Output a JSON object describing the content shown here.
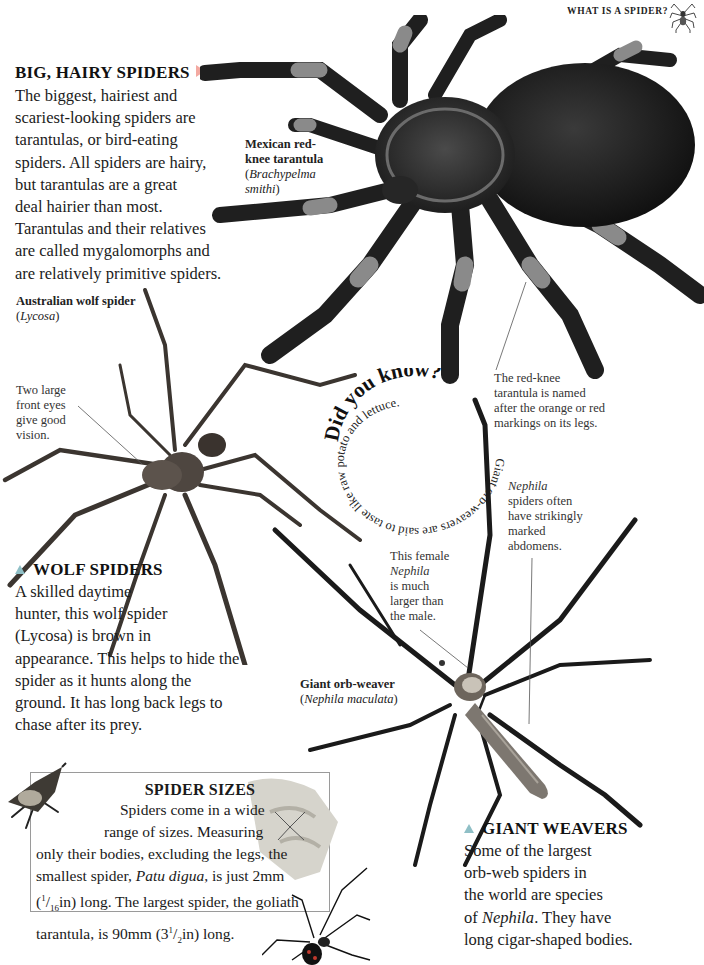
{
  "page": {
    "running_head": "WHAT IS A SPIDER?",
    "accent_colors": {
      "arrow_pink": "#f3a9a1",
      "arrow_teal": "#8fbfc6",
      "box_border": "#9a9a9a",
      "text": "#1b1b1b"
    }
  },
  "big_hairy": {
    "heading": "BIG, HAIRY SPIDERS",
    "lines": [
      "The biggest, hairiest and",
      "scariest-looking spiders are",
      "tarantulas, or bird-eating",
      "spiders. All spiders are hairy,",
      "but tarantulas are a great",
      "deal hairier than most.",
      "Tarantulas and their relatives",
      "are called mygalomorphs and",
      "are relatively primitive spiders."
    ]
  },
  "tarantula": {
    "label_line1": "Mexican red-",
    "label_line2": "knee tarantula",
    "latin_prefix": "(",
    "latin_line1": "Brachypelma",
    "latin_line2": "smithi",
    "latin_suffix": ")",
    "note_lines": [
      "The red-knee",
      "tarantula is named",
      "after the orange or red",
      "markings on its legs."
    ]
  },
  "wolf_spider": {
    "label": "Australian wolf spider",
    "latin": "Lycosa",
    "eyes_note": [
      "Two large",
      "front eyes",
      "give good",
      "vision."
    ],
    "heading": "WOLF SPIDERS",
    "lines": [
      "A skilled daytime",
      "hunter, this wolf spider",
      "(Lycosa) is brown in",
      "appearance. This helps to hide the",
      "spider as it hunts along the",
      "ground. It has long back legs to",
      "chase after its prey."
    ]
  },
  "did_you_know": {
    "title": "Did you know?",
    "spiral_text": "Giant orb-weavers are said to taste like raw potato and lettuce."
  },
  "orb_weaver": {
    "female_note": [
      "This female",
      "Nephila",
      "is much",
      "larger than",
      "the male."
    ],
    "abdomen_note": [
      "Nephila",
      "spiders often",
      "have strikingly",
      "marked",
      "abdomens."
    ],
    "label": "Giant orb-weaver",
    "latin": "Nephila maculata",
    "heading": "GIANT WEAVERS",
    "lines": [
      "Some of the largest",
      "orb-web spiders in",
      "the world are species",
      "of Nephila. They have",
      "long cigar-shaped bodies."
    ]
  },
  "spider_sizes": {
    "heading": "SPIDER SIZES",
    "line1": "Spiders come in a wide",
    "line2": "range of sizes. Measuring",
    "line3": "only their bodies, excluding the legs, the",
    "line4_a": "smallest spider, ",
    "line4_b": "Patu digua",
    "line4_c": ", is just 2mm",
    "line5_a": "(",
    "line5_num": "1",
    "line5_den": "16",
    "line5_b": "in) long. The largest spider, the goliath",
    "line6_a": "tarantula, is 90mm (3",
    "line6_num": "1",
    "line6_den": "2",
    "line6_b": "in) long."
  }
}
